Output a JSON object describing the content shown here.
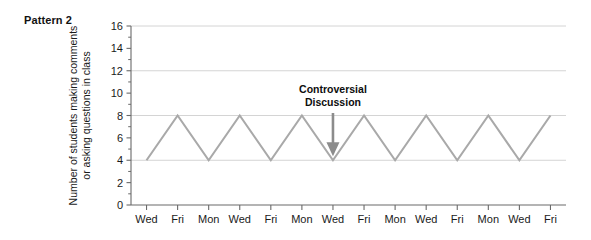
{
  "figure": {
    "pattern_label": "Pattern 2"
  },
  "chart_data": {
    "type": "line",
    "title": "Pattern 2",
    "xlabel": "",
    "ylabel": "Number of students making comments or asking questions in class",
    "ylim": [
      0,
      16
    ],
    "ytick_step": 2,
    "yticks": [
      0,
      2,
      4,
      6,
      8,
      10,
      12,
      14,
      16
    ],
    "ytick_labels": [
      "0",
      "2",
      "4",
      "6",
      "8",
      "10",
      "12",
      "14",
      "16"
    ],
    "gridlines_y": [
      4,
      8,
      12,
      16
    ],
    "grid": true,
    "legend": "none",
    "categories": [
      "Wed",
      "Fri",
      "Mon",
      "Wed",
      "Fri",
      "Mon",
      "Wed",
      "Fri",
      "Mon",
      "Wed",
      "Fri",
      "Mon",
      "Wed",
      "Fri"
    ],
    "values": [
      4,
      8,
      4,
      8,
      4,
      8,
      4,
      8,
      4,
      8,
      4,
      8,
      4,
      8
    ],
    "series": [
      {
        "name": "Number of students making comments or asking questions in class",
        "values": [
          4,
          8,
          4,
          8,
          4,
          8,
          4,
          8,
          4,
          8,
          4,
          8,
          4,
          8
        ]
      }
    ],
    "annotations": [
      {
        "name": "controversial-discussion",
        "line1": "Controversial",
        "line2": "Discussion",
        "points_to_category_index": 6,
        "points_to_value": 4,
        "arrow": "down-arrow"
      }
    ],
    "colors": {
      "line": "#a9a9a9",
      "grid": "#d4d4d4",
      "axis": "#6a6a6a",
      "text": "#1a1a1a",
      "arrow": "#8c8c8c",
      "background": "#ffffff"
    }
  }
}
